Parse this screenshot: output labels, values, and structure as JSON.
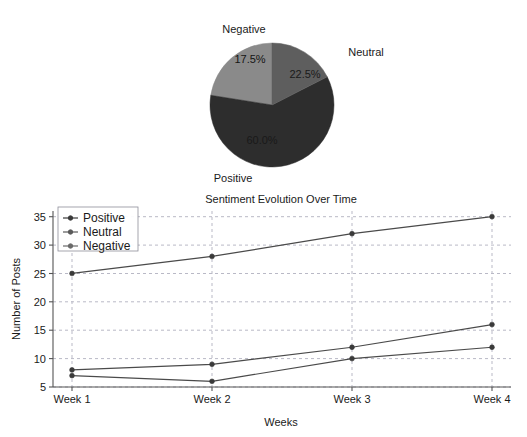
{
  "figure": {
    "background_color": "#ffffff",
    "width": 527,
    "height": 437
  },
  "chart_data": [
    {
      "type": "pie",
      "title": "",
      "labels": [
        "Neutral",
        "Positive",
        "Negative"
      ],
      "values": [
        22.5,
        60.0,
        17.5
      ],
      "value_labels": [
        "22.5%",
        "60.0%",
        "17.5%"
      ],
      "slice_colors": [
        "#8a8a8a",
        "#2d2d2d",
        "#5e5e5e"
      ],
      "outside_labels": {
        "negative": "Negative",
        "neutral": "Neutral",
        "positive": "Positive"
      },
      "start_angle_deg": 90,
      "direction": "counterclockwise",
      "legend": "none"
    },
    {
      "type": "line",
      "title": "Sentiment Evolution Over Time",
      "xlabel": "Weeks",
      "ylabel": "Number of Posts",
      "categories": [
        "Week 1",
        "Week 2",
        "Week 3",
        "Week 4"
      ],
      "ytick_labels": [
        "5",
        "10",
        "15",
        "20",
        "25",
        "30",
        "35"
      ],
      "yticks": [
        5,
        10,
        15,
        20,
        25,
        30,
        35
      ],
      "ylim": [
        5,
        36
      ],
      "grid": true,
      "legend_position": "upper left",
      "series": [
        {
          "name": "Positive",
          "values": [
            25,
            28,
            32,
            35
          ],
          "color": "#3a3a3a"
        },
        {
          "name": "Neutral",
          "values": [
            8,
            9,
            12,
            16
          ],
          "color": "#5a5a5a"
        },
        {
          "name": "Negative",
          "values": [
            7,
            6,
            10,
            12
          ],
          "color": "#6a6a6a"
        }
      ]
    }
  ]
}
